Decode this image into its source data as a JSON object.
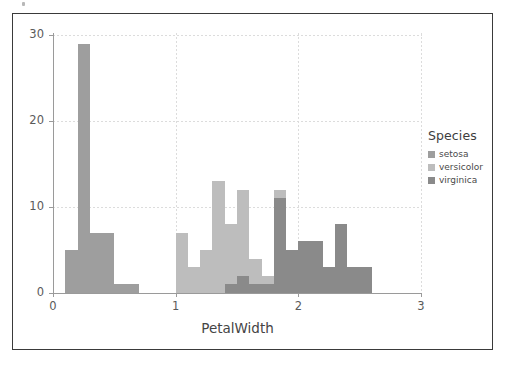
{
  "figure": {
    "background_color": "#ffffff",
    "frame_color": "#3a3a3a"
  },
  "chart_data": {
    "type": "bar",
    "subtype": "layered-histogram",
    "title": "",
    "subtitle": "",
    "xlabel": "PetalWidth",
    "ylabel": "",
    "xlim": [
      0,
      3
    ],
    "ylim": [
      0,
      30
    ],
    "xticks": [
      0,
      1,
      2,
      3
    ],
    "xticklabels": [
      "0",
      "1",
      "2",
      "3"
    ],
    "yticks": [
      0,
      10,
      20,
      30
    ],
    "yticklabels": [
      "0",
      "10",
      "20",
      "30"
    ],
    "grid": true,
    "grid_style": "dotted",
    "bin_width": 0.1,
    "legend": {
      "title": "Species",
      "position": "right",
      "entries": [
        {
          "name": "setosa",
          "color": "#9e9e9e"
        },
        {
          "name": "versicolor",
          "color": "#bdbdbd"
        },
        {
          "name": "virginica",
          "color": "#8a8a8a"
        }
      ]
    },
    "series": [
      {
        "name": "setosa",
        "color": "#9e9e9e",
        "bins": [
          {
            "x0": 0.1,
            "x1": 0.2,
            "count": 5
          },
          {
            "x0": 0.2,
            "x1": 0.3,
            "count": 29
          },
          {
            "x0": 0.3,
            "x1": 0.4,
            "count": 7
          },
          {
            "x0": 0.4,
            "x1": 0.5,
            "count": 7
          },
          {
            "x0": 0.5,
            "x1": 0.6,
            "count": 1
          },
          {
            "x0": 0.6,
            "x1": 0.7,
            "count": 1
          }
        ]
      },
      {
        "name": "versicolor",
        "color": "#bdbdbd",
        "bins": [
          {
            "x0": 1.0,
            "x1": 1.1,
            "count": 7
          },
          {
            "x0": 1.1,
            "x1": 1.2,
            "count": 3
          },
          {
            "x0": 1.2,
            "x1": 1.3,
            "count": 5
          },
          {
            "x0": 1.3,
            "x1": 1.4,
            "count": 13
          },
          {
            "x0": 1.4,
            "x1": 1.5,
            "count": 8
          },
          {
            "x0": 1.5,
            "x1": 1.6,
            "count": 12
          },
          {
            "x0": 1.6,
            "x1": 1.7,
            "count": 4
          },
          {
            "x0": 1.7,
            "x1": 1.8,
            "count": 2
          },
          {
            "x0": 1.8,
            "x1": 1.9,
            "count": 12
          }
        ]
      },
      {
        "name": "virginica",
        "color": "#8a8a8a",
        "bins": [
          {
            "x0": 1.4,
            "x1": 1.5,
            "count": 1
          },
          {
            "x0": 1.5,
            "x1": 1.6,
            "count": 2
          },
          {
            "x0": 1.6,
            "x1": 1.7,
            "count": 1
          },
          {
            "x0": 1.7,
            "x1": 1.8,
            "count": 1
          },
          {
            "x0": 1.8,
            "x1": 1.9,
            "count": 11
          },
          {
            "x0": 1.9,
            "x1": 2.0,
            "count": 5
          },
          {
            "x0": 2.0,
            "x1": 2.1,
            "count": 6
          },
          {
            "x0": 2.1,
            "x1": 2.2,
            "count": 6
          },
          {
            "x0": 2.2,
            "x1": 2.3,
            "count": 3
          },
          {
            "x0": 2.3,
            "x1": 2.4,
            "count": 8
          },
          {
            "x0": 2.4,
            "x1": 2.5,
            "count": 3
          },
          {
            "x0": 2.5,
            "x1": 2.6,
            "count": 3
          }
        ]
      }
    ]
  }
}
